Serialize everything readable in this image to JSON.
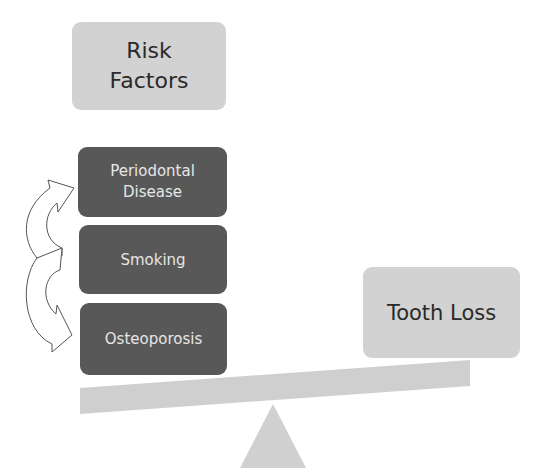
{
  "diagram": {
    "title_box": {
      "label_line1": "Risk",
      "label_line2": "Factors"
    },
    "risk_factors": [
      {
        "label_line1": "Periodontal",
        "label_line2": "Disease"
      },
      {
        "label": "Smoking"
      },
      {
        "label": "Osteoporosis"
      }
    ],
    "outcome_box": {
      "label": "Tooth Loss"
    },
    "elements": {
      "arrows": [
        "curved-arrow-up",
        "curved-arrow-down"
      ],
      "balance": [
        "seesaw-beam",
        "fulcrum-triangle"
      ]
    },
    "colors": {
      "light_box": "#d2d2d2",
      "dark_box": "#585858",
      "beam": "#cfcfcf",
      "fulcrum": "#d0d0d0",
      "arrow_stroke": "#555555"
    }
  }
}
